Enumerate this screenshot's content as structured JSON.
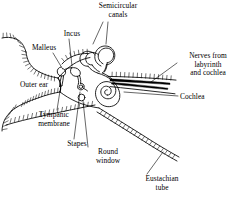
{
  "figure": {
    "kind": "anatomical-line-diagram",
    "background_color": "#ffffff",
    "ink_color": "#000000"
  },
  "labels": {
    "semicircular_canals": "Semicircular\ncanals",
    "incus": "Incus",
    "malleus": "Malleus",
    "outer_ear": "Outer ear",
    "nerves": "Nerves from\nlabyrinth\nand cochlea",
    "cochlea": "Cochlea",
    "tympanic_membrane": "Tympanic\nmembrane",
    "stapes": "Stapes",
    "round_window": "Round\nwindow",
    "eustachian_tube": "Eustachian\ntube"
  }
}
